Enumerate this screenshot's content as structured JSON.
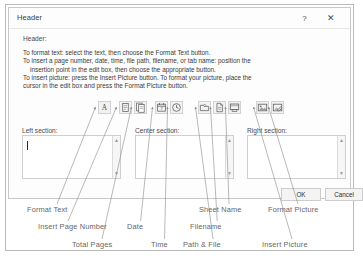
{
  "window": {
    "title": "Header",
    "help_label": "?",
    "close_label": "✕"
  },
  "dialog": {
    "header_label": "Header:",
    "instructions": [
      "To format text:  select the text, then choose the Format Text button.",
      "To insert a page number, date, time, file path, filename, or tab name:  position the",
      "insertion point in the edit box, then choose the appropriate button.",
      "To insert picture: press the Insert Picture button.  To format your picture, place the",
      "cursor in the edit box and press the Format Picture button."
    ],
    "sections": {
      "left_label": "Left section:",
      "center_label": "Center section:",
      "right_label": "Right section:",
      "left_value": "",
      "center_value": "",
      "right_value": ""
    },
    "buttons": {
      "ok_label": "OK",
      "cancel_label": "Cancel"
    },
    "toolbar": [
      {
        "name": "format-text",
        "icon": "format-text-icon",
        "tooltip": "Format Text",
        "x": 0
      },
      {
        "name": "insert-page-number",
        "icon": "page-number-icon",
        "tooltip": "Insert Page Number",
        "x": 21
      },
      {
        "name": "insert-total-pages",
        "icon": "total-pages-icon",
        "tooltip": "Total Pages",
        "x": 36
      },
      {
        "name": "insert-date",
        "icon": "calendar-icon",
        "tooltip": "Date",
        "x": 57
      },
      {
        "name": "insert-time",
        "icon": "clock-icon",
        "tooltip": "Time",
        "x": 72
      },
      {
        "name": "insert-path-file",
        "icon": "folder-path-icon",
        "tooltip": "Path & File",
        "x": 100
      },
      {
        "name": "insert-filename",
        "icon": "file-icon",
        "tooltip": "Filename",
        "x": 115
      },
      {
        "name": "insert-sheet-name",
        "icon": "sheet-tab-icon",
        "tooltip": "Sheet Name",
        "x": 130
      },
      {
        "name": "insert-picture",
        "icon": "picture-icon",
        "tooltip": "Insert Picture",
        "x": 158
      },
      {
        "name": "format-picture",
        "icon": "format-picture-icon",
        "tooltip": "Format Picture",
        "x": 173
      }
    ]
  },
  "annotations": [
    {
      "id": "format-text",
      "text": "Format Text",
      "x": 27,
      "y": 205
    },
    {
      "id": "insert-page-number",
      "text": "Insert Page Number",
      "x": 38,
      "y": 222
    },
    {
      "id": "total-pages",
      "text": "Total Pages",
      "x": 72,
      "y": 240
    },
    {
      "id": "date",
      "text": "Date",
      "x": 127,
      "y": 222
    },
    {
      "id": "time",
      "text": "Time",
      "x": 151,
      "y": 240
    },
    {
      "id": "path-and-file",
      "text": "Path & File",
      "x": 183,
      "y": 240
    },
    {
      "id": "filename",
      "text": "Filename",
      "x": 190,
      "y": 222
    },
    {
      "id": "sheet-name",
      "text": "Sheet Name",
      "x": 199,
      "y": 205
    },
    {
      "id": "insert-picture",
      "text": "Insert Picture",
      "x": 262,
      "y": 240
    },
    {
      "id": "format-picture",
      "text": "Format Picture",
      "x": 268,
      "y": 205
    }
  ]
}
